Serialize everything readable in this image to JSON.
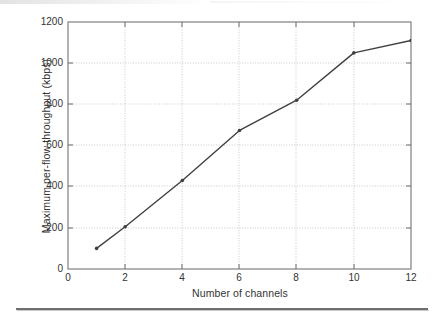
{
  "figure": {
    "kind": "line-plot-figure"
  },
  "chart_data": {
    "type": "line",
    "title": "",
    "subtitle": "",
    "xlabel": "Number of channels",
    "ylabel": "Maximum per-flow throughput (kbps)",
    "x": [
      1,
      2,
      4,
      6,
      8,
      10,
      12
    ],
    "values": [
      100,
      205,
      430,
      673,
      820,
      1050,
      1110
    ],
    "series": [
      {
        "name": "Maximum per-flow throughput",
        "x": [
          1,
          2,
          4,
          6,
          8,
          10,
          12
        ],
        "values": [
          100,
          205,
          430,
          673,
          820,
          1050,
          1110
        ]
      }
    ],
    "xlim": [
      0,
      12
    ],
    "ylim": [
      0,
      1200
    ],
    "xticks": [
      0,
      2,
      4,
      6,
      8,
      10,
      12
    ],
    "yticks": [
      0,
      200,
      400,
      600,
      800,
      1000,
      1200
    ],
    "xtick_labels": [
      "0",
      "2",
      "4",
      "6",
      "8",
      "10",
      "12"
    ],
    "ytick_labels": [
      "0",
      "200",
      "400",
      "600",
      "800",
      "1000",
      "1200"
    ],
    "grid": true,
    "grid_style": "dotted",
    "legend": null,
    "legend_position": "none",
    "marker": "dot",
    "line_color": "#404040",
    "grid_color": "#b8b8b8",
    "axis_color": "#707070",
    "annotations": []
  },
  "ticks": {
    "y": [
      {
        "label": "1200",
        "value": 1200
      },
      {
        "label": "1000",
        "value": 1000
      },
      {
        "label": "800",
        "value": 800
      },
      {
        "label": "600",
        "value": 600
      },
      {
        "label": "400",
        "value": 400
      },
      {
        "label": "200",
        "value": 200
      },
      {
        "label": "0",
        "value": 0
      }
    ],
    "x": [
      {
        "label": "0",
        "value": 0
      },
      {
        "label": "2",
        "value": 2
      },
      {
        "label": "4",
        "value": 4
      },
      {
        "label": "6",
        "value": 6
      },
      {
        "label": "8",
        "value": 8
      },
      {
        "label": "10",
        "value": 10
      },
      {
        "label": "12",
        "value": 12
      }
    ]
  }
}
